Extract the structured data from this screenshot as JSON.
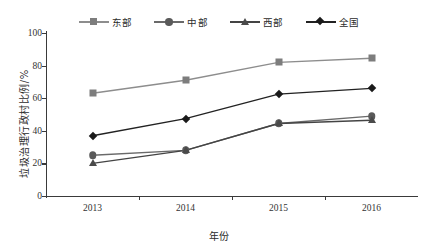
{
  "chart_data": {
    "type": "line",
    "title": "",
    "xlabel": "年份",
    "ylabel": "垃圾治理行政村比例/%",
    "categories": [
      "2013",
      "2014",
      "2015",
      "2016"
    ],
    "x_tick_labels": [
      "2013",
      "2014",
      "2015",
      "2016"
    ],
    "y_tick_labels": [
      "0",
      "20",
      "40",
      "60",
      "80",
      "100"
    ],
    "y_ticks": [
      0,
      20,
      40,
      60,
      80,
      100
    ],
    "ylim": [
      0,
      100
    ],
    "grid": false,
    "legend_position": "top-center",
    "series": [
      {
        "name": "东部",
        "marker": "square",
        "color": "#7d7d7d",
        "line_color": "#8d8d8d",
        "values": [
          63,
          71,
          82,
          84.5
        ]
      },
      {
        "name": "中部",
        "marker": "circle",
        "color": "#5a5a5a",
        "line_color": "#6a6a6a",
        "values": [
          25,
          28,
          44.5,
          49
        ]
      },
      {
        "name": "西部",
        "marker": "triangle",
        "color": "#4a4a4a",
        "line_color": "#444444",
        "values": [
          20,
          28,
          44.5,
          46.5
        ]
      },
      {
        "name": "全国",
        "marker": "diamond",
        "color": "#1a1a1a",
        "line_color": "#222222",
        "values": [
          37,
          47.5,
          62.5,
          66
        ]
      }
    ]
  },
  "axis": {
    "line_color": "#3a3a3a"
  }
}
